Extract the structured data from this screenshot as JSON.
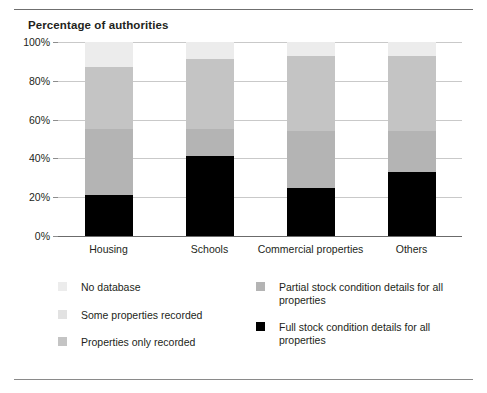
{
  "rules": {
    "top": "horizontal-rule",
    "bottom": "horizontal-rule"
  },
  "chart_data": {
    "type": "bar",
    "subtype": "stacked-bar-percent",
    "title": "Percentage of authorities",
    "xlabel": "",
    "ylabel": "",
    "ylim": [
      0,
      100
    ],
    "yticks": [
      "0%",
      "20%",
      "40%",
      "60%",
      "80%",
      "100%"
    ],
    "ytick_values": [
      0,
      20,
      40,
      60,
      80,
      100
    ],
    "grid": true,
    "legend_position": "bottom",
    "categories": [
      "Housing",
      "Schools",
      "Commercial properties",
      "Others"
    ],
    "series": [
      {
        "name": "Full stock condition details for all properties",
        "color": "#000000",
        "values": [
          21,
          41,
          25,
          33
        ]
      },
      {
        "name": "Partial stock condition details for all properties",
        "color": "#b4b4b4",
        "values": [
          34,
          14,
          29,
          21
        ]
      },
      {
        "name": "Properties only recorded",
        "color": "#c4c4c4",
        "values": [
          32,
          36,
          39,
          39
        ]
      },
      {
        "name": "Some properties recorded",
        "color": "#e2e2e2",
        "values": [
          0,
          0,
          0,
          0
        ]
      },
      {
        "name": "No database",
        "color": "#ececec",
        "values": [
          13,
          9,
          7,
          7
        ]
      }
    ],
    "legend_entries": [
      {
        "label": "No database",
        "color": "#ececec",
        "column": "left"
      },
      {
        "label": "Some properties recorded",
        "color": "#e2e2e2",
        "column": "left"
      },
      {
        "label": "Properties only recorded",
        "color": "#c4c4c4",
        "column": "left"
      },
      {
        "label": "Partial stock condition details for all properties",
        "color": "#b4b4b4",
        "column": "right"
      },
      {
        "label": "Full stock condition details for all properties",
        "color": "#000000",
        "column": "right"
      }
    ]
  }
}
